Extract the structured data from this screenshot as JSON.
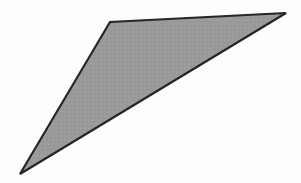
{
  "canvas": {
    "width": 301,
    "height": 183,
    "background_color": "#fdfdfd",
    "description": "Scanned line-art geometric figure on a plain white page"
  },
  "figure": {
    "name": "shaded-triangle",
    "type": "polygon",
    "sides": 3,
    "fill_color": "#9a9a9a",
    "stroke_color": "#262626",
    "stroke_width": 2.2,
    "points_attr": "20,174 110,22 286,13",
    "vertices": [
      {
        "label": "bottom-left-apex",
        "x": 20,
        "y": 174
      },
      {
        "label": "top-left-vertex",
        "x": 110,
        "y": 22
      },
      {
        "label": "top-right-apex",
        "x": 286,
        "y": 13
      }
    ],
    "edges": [
      {
        "label": "left-edge",
        "from": "top-left-vertex",
        "to": "bottom-left-apex"
      },
      {
        "label": "top-edge",
        "from": "top-left-vertex",
        "to": "top-right-apex"
      },
      {
        "label": "hypotenuse-edge",
        "from": "bottom-left-apex",
        "to": "top-right-apex"
      }
    ]
  },
  "texture": {
    "name": "halftone-noise",
    "base_color": "#9a9a9a",
    "speckle_light": "#a6a6a6",
    "speckle_dark": "#8e8e8e",
    "opacity": 0.55
  }
}
